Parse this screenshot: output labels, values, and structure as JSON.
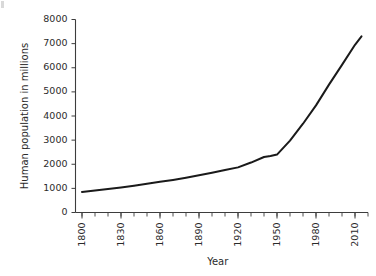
{
  "chart_data": {
    "type": "line",
    "title": "",
    "xlabel": "Year",
    "ylabel": "Human population in millions",
    "xlim": [
      1795,
      2020
    ],
    "ylim": [
      0,
      8000
    ],
    "grid": false,
    "legend": "none",
    "x_ticks": [
      1800,
      1830,
      1860,
      1890,
      1920,
      1950,
      1980,
      2010
    ],
    "x_tick_labels": [
      "1800",
      "1830",
      "1860",
      "1890",
      "1920",
      "1950",
      "1980",
      "2010"
    ],
    "x_minor_tick_step": 10,
    "y_ticks": [
      0,
      1000,
      2000,
      3000,
      4000,
      5000,
      6000,
      7000,
      8000
    ],
    "y_tick_labels": [
      "0",
      "1000",
      "2000",
      "3000",
      "4000",
      "5000",
      "6000",
      "7000",
      "8000"
    ],
    "series": [
      {
        "name": "Human population",
        "color": "#1a1a1a",
        "x": [
          1800,
          1810,
          1820,
          1830,
          1840,
          1850,
          1860,
          1870,
          1880,
          1890,
          1900,
          1910,
          1920,
          1930,
          1940,
          1945,
          1950,
          1960,
          1970,
          1980,
          1990,
          2000,
          2010,
          2015
        ],
        "y": [
          850,
          910,
          970,
          1040,
          1110,
          1190,
          1270,
          1350,
          1440,
          1540,
          1650,
          1760,
          1870,
          2070,
          2300,
          2340,
          2400,
          2980,
          3680,
          4440,
          5300,
          6120,
          6950,
          7300
        ]
      }
    ]
  },
  "axes": {
    "x_title": "Year",
    "y_title": "Human population in millions"
  }
}
